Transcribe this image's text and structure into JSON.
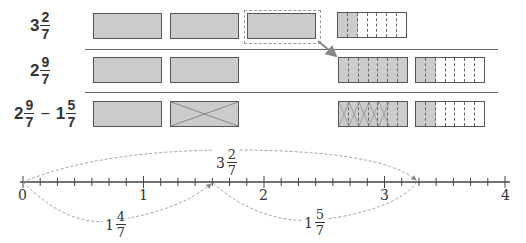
{
  "rows": [
    {
      "label": {
        "whole": "3",
        "num": "2",
        "den": "7"
      }
    },
    {
      "label": {
        "whole": "2",
        "num": "9",
        "den": "7"
      }
    },
    {
      "label": {
        "whole": "2",
        "num": "9",
        "den": "7",
        "minus": "−",
        "whole2": "1",
        "num2": "5",
        "den2": "7"
      }
    }
  ],
  "number_line": {
    "ticks": [
      "0",
      "1",
      "2",
      "3",
      "4"
    ],
    "subdivisions_per_unit": 7,
    "top_arc": {
      "whole": "3",
      "num": "2",
      "den": "7"
    },
    "bottom_arc_1": {
      "whole": "1",
      "num": "4",
      "den": "7"
    },
    "bottom_arc_2": {
      "whole": "1",
      "num": "5",
      "den": "7"
    }
  },
  "colors": {
    "fill": "#cccccc",
    "stroke": "#555555",
    "arrow": "#888888"
  }
}
